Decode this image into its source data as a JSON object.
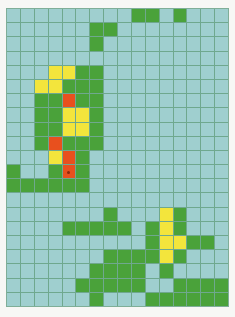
{
  "board": {
    "columns": 16,
    "rows": 21,
    "colors": {
      "empty": "#9fcfcf",
      "G": "#4aa23a",
      "Y": "#f3e53c",
      "R": "#e8501e",
      "gridline": "#6fa88e"
    },
    "legend": {
      ".": "empty",
      "G": "green",
      "Y": "yellow",
      "R": "red"
    },
    "grid": [
      ".........GG.G...",
      "......GG........",
      "......G.........",
      "................",
      "...YYGG.........",
      "..YYGGG.........",
      "..GGRGG.........",
      "..GGYYG.........",
      "..GGYYG.........",
      "..GRGGG.........",
      "...YRG..........",
      "G..GRG..........",
      "GGGGGG..........",
      "................",
      ".......G...YG...",
      "....GGGGG.GYG...",
      "..........GYYGG.",
      ".......GGGGYG...",
      "......GGGG.G....",
      ".....GGGGG..GGGG",
      "......G...GGGGGG"
    ],
    "marker": {
      "row": 11,
      "col": 4,
      "name": "player-marker"
    }
  }
}
